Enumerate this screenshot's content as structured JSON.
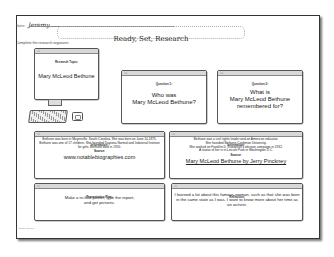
{
  "header": {
    "name_label": "Name:",
    "name_value": "Jeremy",
    "title": "Ready, Set, Research",
    "instructions": "Complete the research organizer."
  },
  "window_dots": "○○",
  "cards": {
    "research_topic": {
      "label": "Research Topic:",
      "text": "Mary McLeod Bethune"
    },
    "question_1": {
      "label": "Question 1:",
      "line1": "Who was",
      "line2": "Mary McLeod Bethune?"
    },
    "question_2": {
      "label": "Question 2:",
      "line1": "What is",
      "line2": "Mary McLeod Bethune",
      "line3": "remembered for?"
    },
    "information_1": {
      "label": "Information:",
      "text": "Bethune was born in Mayesville, South Carolina. She was born on June 10,1875. Bethune was one of 17 children. She founded Daytona Normal and Industrial Institute for girls. Bethune died in 1955.",
      "source_label": "Source:",
      "source": "www.notablebiographies.com"
    },
    "information_2": {
      "label": "Information:",
      "text_lines": [
        "Bethune was a civil rights leader and an American educator.",
        "She founded Bethune-Cookman University.",
        "She worked on Franklin D. Roosevelt's election campaign in 1932.",
        "A statue of her is in Lincoln Park in Washington D.C."
      ],
      "source_label": "Source:",
      "source": "Mary McLeod Bethune by Jerry Pinckney"
    },
    "presentation_plan": {
      "label": "Presentation Plan:",
      "line1": "Make a tri-fold poster, type the report,",
      "line2": "and get pictures."
    },
    "reflection": {
      "label": "Reflection:",
      "text": "I learned a lot about this famous woman, such as that she was born in the same state as I was. I want to know more about her time as an activist."
    }
  },
  "footer": {
    "copyright": "© Ceane Carlone"
  }
}
